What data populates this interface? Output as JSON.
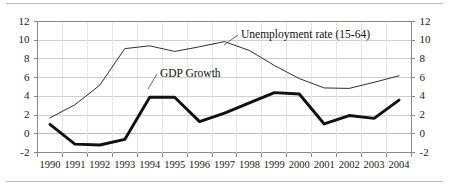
{
  "chart_data": {
    "type": "line",
    "title": "",
    "subtitle": "",
    "xlabel": "",
    "ylabel": "",
    "ylim": [
      -2,
      12
    ],
    "yticks": [
      -2,
      0,
      2,
      4,
      6,
      8,
      10,
      12
    ],
    "ytick_labels": [
      "-2",
      "0",
      "2",
      "4",
      "6",
      "8",
      "10",
      "12"
    ],
    "y_axis_right_mirrored": true,
    "grid": "horizontal-major-light",
    "legend_position": "inline-annotations-with-leader-lines",
    "categories": [
      1990,
      1991,
      1992,
      1993,
      1994,
      1995,
      1996,
      1997,
      1998,
      1999,
      2000,
      2001,
      2002,
      2003,
      2004
    ],
    "xtick_labels": [
      "1990",
      "1991",
      "1992",
      "1993",
      "1994",
      "1995",
      "1996",
      "1997",
      "1998",
      "1999",
      "2000",
      "2001",
      "2002",
      "2003",
      "2004"
    ],
    "series": [
      {
        "name": "Unemployment rate (15-64)",
        "values": [
          1.7,
          3.1,
          5.2,
          9.1,
          9.4,
          8.8,
          9.3,
          9.85,
          8.9,
          7.3,
          5.9,
          4.9,
          4.85,
          5.5,
          6.2
        ],
        "style": "thin",
        "color": "#1a1a1a"
      },
      {
        "name": "GDP Growth",
        "values": [
          1.0,
          -1.1,
          -1.2,
          -0.6,
          3.9,
          3.9,
          1.3,
          2.2,
          3.3,
          4.4,
          4.25,
          1.05,
          1.95,
          1.65,
          3.6
        ],
        "style": "thick",
        "color": "#111111"
      }
    ],
    "annotations": [
      {
        "text": "Unemployment rate (15-64)",
        "anchor_year": 1997,
        "anchor_value": 9.85
      },
      {
        "text": "GDP Growth",
        "anchor_year": 1994,
        "anchor_value": 3.9
      }
    ]
  },
  "axes": {
    "left_ticks": [
      "12",
      "10",
      "8",
      "6",
      "4",
      "2",
      "0",
      "-2"
    ],
    "right_ticks": [
      "12",
      "10",
      "8",
      "6",
      "4",
      "2",
      "0",
      "-2"
    ],
    "years": [
      "1990",
      "1991",
      "1992",
      "1993",
      "1994",
      "1995",
      "1996",
      "1997",
      "1998",
      "1999",
      "2000",
      "2001",
      "2002",
      "2003",
      "2004"
    ]
  },
  "labels": {
    "unemployment": "Unemployment rate (15-64)",
    "gdp": "GDP Growth"
  },
  "colors": {
    "line": "#1a1a1a",
    "grid": "#cfcfcf",
    "frame": "#8a8a8a",
    "background": "#ffffff",
    "zero_line": "#bdbdbd"
  }
}
